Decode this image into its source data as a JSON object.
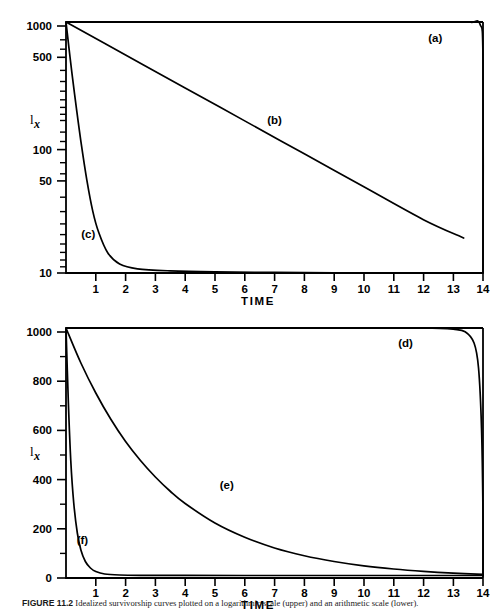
{
  "figure": {
    "caption_label": "FIGURE 11.2",
    "caption_text": "Idealized survivorship curves plotted on a logarithmic scale (upper) and an arithmetic scale (lower)."
  },
  "chart_data": [
    {
      "type": "line",
      "id": "upper-plot",
      "title": "",
      "xlabel": "TIME",
      "ylabel": "Ix",
      "yscale": "log",
      "ylim": [
        10,
        1000
      ],
      "xlim": [
        0,
        14
      ],
      "ytick_labels": [
        "1000",
        "500",
        "100",
        "50",
        "10"
      ],
      "ytick_values": [
        1000,
        500,
        100,
        50,
        10
      ],
      "xtick_labels": [
        "1",
        "2",
        "3",
        "4",
        "5",
        "6",
        "7",
        "8",
        "9",
        "10",
        "11",
        "12",
        "13",
        "14"
      ],
      "xtick_values": [
        1,
        2,
        3,
        4,
        5,
        6,
        7,
        8,
        9,
        10,
        11,
        12,
        13,
        14
      ],
      "grid": false,
      "legend": "inline-annotations",
      "series": [
        {
          "name": "(a)",
          "label_x": 12.4,
          "label_y": 690,
          "description": "Type I survivorship: constant near 1000 then vertical drop at t=14",
          "x": [
            0,
            1,
            2,
            3,
            4,
            5,
            6,
            7,
            8,
            9,
            10,
            11,
            12,
            13,
            13.6,
            13.9,
            14.0,
            14.0
          ],
          "y": [
            1000,
            1000,
            1000,
            1000,
            1000,
            1000,
            1000,
            1000,
            1000,
            1000,
            1000,
            1000,
            1000,
            1000,
            995,
            960,
            500,
            10
          ]
        },
        {
          "name": "(b)",
          "label_x": 7.0,
          "label_y": 155,
          "description": "Type II survivorship: straight line on log scale from 1000 to 10",
          "x": [
            0,
            2,
            4,
            6,
            8,
            10,
            12,
            13.35
          ],
          "y": [
            1000,
            546,
            298,
            163,
            89,
            48.6,
            26.6,
            19.0
          ]
        },
        {
          "name": "(c)",
          "label_x": 0.75,
          "label_y": 19,
          "description": "Type III survivorship: steep early drop from 1000 to near 10",
          "x": [
            0,
            0.1,
            0.2,
            0.35,
            0.5,
            0.7,
            0.9,
            1.1,
            1.4,
            1.8,
            2.4,
            3.5,
            5,
            7,
            9,
            11,
            13,
            14
          ],
          "y": [
            1000,
            620,
            390,
            205,
            112,
            55,
            31,
            21,
            14.5,
            11.8,
            10.8,
            10.4,
            10.2,
            10.1,
            10.05,
            10.03,
            10.01,
            10.0
          ]
        }
      ]
    },
    {
      "type": "line",
      "id": "lower-plot",
      "title": "",
      "xlabel": "TIME",
      "ylabel": "Ix",
      "yscale": "linear",
      "ylim": [
        0,
        1000
      ],
      "xlim": [
        0,
        14
      ],
      "ytick_labels": [
        "0",
        "200",
        "400",
        "600",
        "800",
        "1000"
      ],
      "ytick_values": [
        0,
        200,
        400,
        600,
        800,
        1000
      ],
      "xtick_labels": [
        "1",
        "2",
        "3",
        "4",
        "5",
        "6",
        "7",
        "8",
        "9",
        "10",
        "11",
        "12",
        "13",
        "14"
      ],
      "xtick_values": [
        1,
        2,
        3,
        4,
        5,
        6,
        7,
        8,
        9,
        10,
        11,
        12,
        13,
        14
      ],
      "grid": false,
      "legend": "inline-annotations",
      "series": [
        {
          "name": "(d)",
          "label_x": 11.4,
          "label_y": 925,
          "description": "Type I survivorship on arithmetic scale: flat at 1000 then sharp drop near t=14",
          "x": [
            0,
            2,
            4,
            6,
            8,
            10,
            12,
            13,
            13.4,
            13.7,
            13.85,
            13.95,
            14.0,
            14.0
          ],
          "y": [
            1000,
            1000,
            1000,
            1000,
            1000,
            1000,
            1000,
            995,
            985,
            940,
            840,
            600,
            250,
            8
          ]
        },
        {
          "name": "(e)",
          "label_x": 5.4,
          "label_y": 355,
          "description": "Type II survivorship on arithmetic scale: exponential decay from 1000",
          "x": [
            0,
            0.5,
            1,
            1.5,
            2,
            2.5,
            3,
            3.5,
            4,
            5,
            6,
            7,
            8,
            9,
            10,
            11,
            12,
            13,
            14
          ],
          "y": [
            1000,
            860,
            740,
            636,
            546,
            470,
            404,
            347,
            298,
            220,
            163,
            120,
            89,
            66,
            48.6,
            36,
            26.6,
            19.6,
            14.5
          ]
        },
        {
          "name": "(f)",
          "label_x": 0.55,
          "label_y": 135,
          "description": "Type III survivorship on arithmetic scale: immediate crash to near zero",
          "x": [
            0,
            0.08,
            0.16,
            0.26,
            0.38,
            0.5,
            0.65,
            0.82,
            1.0,
            1.3,
            1.8,
            2.5,
            4,
            6,
            9,
            12,
            14
          ],
          "y": [
            1000,
            700,
            470,
            300,
            180,
            112,
            66,
            40,
            26,
            16,
            12,
            10.6,
            10.2,
            10.1,
            10.0,
            10.0,
            10.0
          ]
        }
      ]
    }
  ]
}
